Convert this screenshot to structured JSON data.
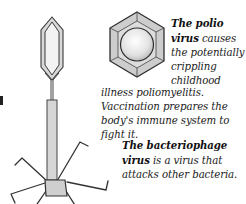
{
  "figures": {
    "bacteriophage": {
      "label": "bacteriophage-illustration",
      "colors": {
        "outline": "#3a3a3a",
        "fill": "#d9d9d9",
        "head_inner": "#f2f2f2"
      }
    },
    "polio": {
      "label": "polio-virus-illustration",
      "colors": {
        "outline": "#2e2e2e",
        "facet_fill": "#cfcfcf",
        "sphere_fill": "#e6e6e6"
      }
    }
  },
  "captions": {
    "polio": {
      "title_line1": "The polio",
      "title_line2": "virus",
      "text_line2_rest": " causes",
      "text_line3": "the potentially",
      "text_line4": "crippling",
      "text_line5": "childhood",
      "text_continued": "illness poliomyelitis. Vaccination prepares the body's immune system to fight it."
    },
    "bacteriophage": {
      "title": "The bacteriophage virus",
      "text": "is a virus that attacks other bacteria."
    }
  }
}
